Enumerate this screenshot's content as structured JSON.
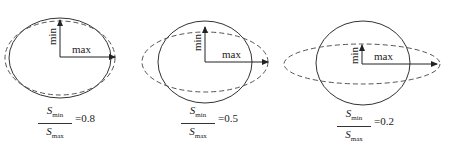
{
  "diagram": {
    "colors": {
      "line": "#333333",
      "background": "#ffffff"
    },
    "panels": [
      {
        "id": "panel-1",
        "solid_circle": {
          "cx": 60,
          "cy": 58,
          "rx": 51,
          "ry": 40
        },
        "dashed_ellipse": {
          "cx": 60,
          "cy": 58,
          "rx": 55,
          "ry": 37
        },
        "origin": {
          "x": 60,
          "y": 57
        },
        "min_arrow_end_y": 20,
        "max_arrow_end_x": 115,
        "min_label": "min",
        "max_label": "max",
        "formula": {
          "numerator": "S",
          "numerator_sub": "min",
          "denominator": "S",
          "denominator_sub": "max",
          "value": "=0.8"
        }
      },
      {
        "id": "panel-2",
        "solid_circle": {
          "cx": 205,
          "cy": 62,
          "rx": 47,
          "ry": 41
        },
        "dashed_ellipse": {
          "cx": 205,
          "cy": 62,
          "rx": 63,
          "ry": 30
        },
        "origin": {
          "x": 205,
          "y": 62
        },
        "min_arrow_end_y": 27,
        "max_arrow_end_x": 268,
        "min_label": "min",
        "max_label": "max",
        "formula": {
          "numerator": "S",
          "numerator_sub": "min",
          "denominator": "S",
          "denominator_sub": "max",
          "value": "=0.5"
        }
      },
      {
        "id": "panel-3",
        "solid_circle": {
          "cx": 363,
          "cy": 63,
          "rx": 47,
          "ry": 42
        },
        "dashed_ellipse": {
          "cx": 362,
          "cy": 64,
          "rx": 78,
          "ry": 20
        },
        "origin": {
          "x": 362,
          "y": 64
        },
        "min_arrow_end_y": 45,
        "max_arrow_end_x": 437,
        "min_label": "min",
        "max_label": "max",
        "formula": {
          "numerator": "S",
          "numerator_sub": "min",
          "denominator": "S",
          "denominator_sub": "max",
          "value": "=0.2"
        }
      }
    ]
  }
}
